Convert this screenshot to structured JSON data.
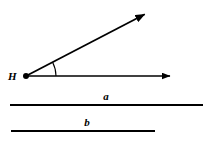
{
  "figure": {
    "type": "geometry-diagram",
    "background_color": "#ffffff",
    "stroke_color": "#000000",
    "width": 211,
    "height": 141
  },
  "angle": {
    "vertex_label": "H",
    "vertex_point": {
      "x": 26,
      "y": 76
    },
    "vertex_dot_radius": 3,
    "rays": [
      {
        "name": "horizontal-ray",
        "from": {
          "x": 26,
          "y": 76
        },
        "to": {
          "x": 176,
          "y": 76
        },
        "has_arrowhead": true,
        "direction_degrees": 0
      },
      {
        "name": "diagonal-ray",
        "from": {
          "x": 26,
          "y": 76
        },
        "to": {
          "x": 151,
          "y": 11
        },
        "has_arrowhead": true,
        "direction_degrees": 27.5
      }
    ],
    "arc": {
      "name": "angle-arc",
      "radius": 30,
      "start_degrees": 0,
      "end_degrees": 27.5,
      "measure_label": ""
    }
  },
  "lines": [
    {
      "label": "a",
      "label_position": {
        "x": 106,
        "y": 100
      },
      "segment": {
        "x1": 10,
        "y1": 105,
        "x2": 203,
        "y2": 105
      },
      "length_px": 193
    },
    {
      "label": "b",
      "label_position": {
        "x": 87,
        "y": 126
      },
      "segment": {
        "x1": 11,
        "y1": 131,
        "x2": 155,
        "y2": 131
      },
      "length_px": 144
    }
  ]
}
